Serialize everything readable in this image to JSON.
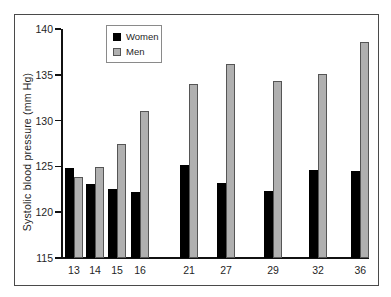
{
  "figure": {
    "background": "#ffffff",
    "border_color": "#4a4a4a"
  },
  "legend": {
    "items": [
      {
        "label": "Women",
        "swatch_color": "#000000",
        "swatch_border": "#000000"
      },
      {
        "label": "Men",
        "swatch_color": "#b0b0b0",
        "swatch_border": "#555555"
      }
    ]
  },
  "chart_data": {
    "type": "bar",
    "title": "",
    "xlabel": "",
    "ylabel": "Systolic blood pressure (mm Hg)",
    "ylim": [
      115,
      140
    ],
    "yticks": [
      115,
      120,
      125,
      130,
      135,
      140
    ],
    "grid": false,
    "legend_position": "upper-left-inset",
    "categories": [
      "13",
      "14",
      "15",
      "16",
      "21",
      "27",
      "29",
      "32",
      "36"
    ],
    "series": [
      {
        "name": "Women",
        "color": "#000000",
        "border_color": "#000000",
        "values": [
          124.8,
          123.1,
          122.5,
          122.2,
          125.2,
          123.2,
          122.3,
          124.6,
          124.5
        ]
      },
      {
        "name": "Men",
        "color": "#b0b0b0",
        "border_color": "#555555",
        "values": [
          123.8,
          124.9,
          127.5,
          131.1,
          134.0,
          136.2,
          134.3,
          135.1,
          138.6
        ]
      }
    ],
    "category_x_frac": [
      0.039,
      0.108,
      0.18,
      0.255,
      0.415,
      0.536,
      0.69,
      0.837,
      0.975
    ],
    "bar_width_px": 9
  }
}
